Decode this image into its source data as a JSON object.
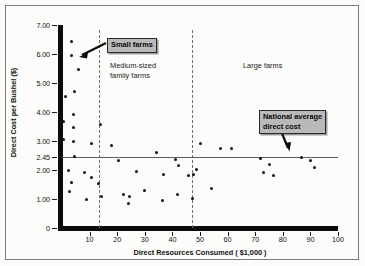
{
  "chart_data": {
    "type": "scatter",
    "title": "",
    "xlabel": "Direct Resources Consumed ( $1,000 )",
    "ylabel": "Direct Cost per Bushel ($)",
    "xlim": [
      0,
      100
    ],
    "ylim": [
      0,
      7.0
    ],
    "grid": false,
    "legend": "none",
    "xticks": [
      "10",
      "20",
      "30",
      "40",
      "50",
      "60",
      "70",
      "80",
      "90",
      "100"
    ],
    "xtick_values": [
      10,
      20,
      30,
      40,
      50,
      60,
      70,
      80,
      90,
      100
    ],
    "yticks": [
      "7.00",
      "6.00",
      "5.00",
      "4.00",
      "3.00",
      "2.45",
      "2.00",
      "1.00",
      "0"
    ],
    "ytick_values": [
      7.0,
      6.0,
      5.0,
      4.0,
      3.0,
      2.45,
      2.0,
      1.0,
      0
    ],
    "reference_line": {
      "label": "National average direct cost",
      "y": 2.45,
      "orientation": "horizontal"
    },
    "dividers": [
      {
        "x": 13.5,
        "style": "dashed"
      },
      {
        "x": 47.0,
        "style": "dashed"
      }
    ],
    "annotations": [
      {
        "text": "Small farms",
        "kind": "callout",
        "points_to": [
          4.0,
          5.95
        ]
      },
      {
        "text": "Medium-sized\nfamily farms",
        "kind": "text"
      },
      {
        "text": "Large farms",
        "kind": "text"
      },
      {
        "text": "National average\ndirect cost",
        "kind": "callout",
        "points_to": [
          75.5,
          2.45
        ]
      }
    ],
    "series": [
      {
        "name": "Farms",
        "points": [
          [
            3.3,
            6.42
          ],
          [
            3.4,
            5.96
          ],
          [
            5.8,
            5.45
          ],
          [
            1.3,
            4.52
          ],
          [
            4.6,
            4.7
          ],
          [
            4.0,
            3.93
          ],
          [
            0.6,
            3.68
          ],
          [
            4.2,
            3.45
          ],
          [
            13.9,
            3.56
          ],
          [
            0.5,
            3.05
          ],
          [
            4.0,
            2.98
          ],
          [
            10.6,
            2.93
          ],
          [
            17.8,
            2.84
          ],
          [
            4.6,
            2.46
          ],
          [
            20.4,
            2.34
          ],
          [
            50.1,
            2.92
          ],
          [
            57.4,
            2.73
          ],
          [
            61.4,
            2.74
          ],
          [
            34.2,
            2.6
          ],
          [
            41.0,
            2.37
          ],
          [
            71.8,
            2.38
          ],
          [
            86.8,
            2.42
          ],
          [
            89.9,
            2.34
          ],
          [
            2.3,
            1.99
          ],
          [
            8.0,
            1.9
          ],
          [
            73.0,
            1.92
          ],
          [
            75.3,
            2.19
          ],
          [
            76.6,
            1.8
          ],
          [
            91.6,
            2.09
          ],
          [
            46.0,
            1.82
          ],
          [
            47.8,
            1.83
          ],
          [
            48.9,
            2.03
          ],
          [
            42.2,
            2.17
          ],
          [
            36.7,
            1.84
          ],
          [
            27.0,
            1.95
          ],
          [
            10.8,
            1.73
          ],
          [
            3.6,
            1.56
          ],
          [
            2.8,
            1.25
          ],
          [
            13.3,
            1.54
          ],
          [
            30.0,
            1.29
          ],
          [
            24.5,
            1.07
          ],
          [
            22.3,
            1.15
          ],
          [
            24.0,
            0.86
          ],
          [
            54.0,
            1.35
          ],
          [
            41.8,
            1.16
          ],
          [
            36.5,
            0.96
          ],
          [
            47.2,
            1.03
          ],
          [
            14.2,
            1.07
          ],
          [
            9.0,
            0.97
          ]
        ]
      }
    ]
  },
  "axes": {
    "y_title": "Direct Cost per Bushel ($)",
    "x_title": "Direct Resources Consumed ( $1,000 )"
  },
  "labels": {
    "small_farms": "Small farms",
    "medium_farms": "Medium-sized\nfamily farms",
    "large_farms": "Large farms",
    "national_average": "National average\ndirect cost"
  },
  "colors": {
    "background": "#fbfbf9",
    "frame_border": "#7c7c7c",
    "axis": "#0b0b0b",
    "point": "#131313",
    "reference_line": "#5f5f5f",
    "divider": "#6f6f6f",
    "callout_fill": "#b9b9b9",
    "callout_border": "#2a2a2a",
    "text": "#111111"
  }
}
